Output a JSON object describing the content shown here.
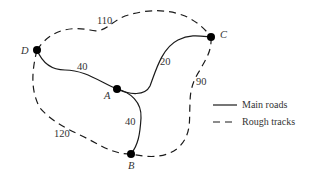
{
  "diagram": {
    "type": "network-graph",
    "nodes": [
      {
        "id": "A",
        "label": "A"
      },
      {
        "id": "B",
        "label": "B"
      },
      {
        "id": "C",
        "label": "C"
      },
      {
        "id": "D",
        "label": "D"
      }
    ],
    "edges": [
      {
        "from": "D",
        "to": "A",
        "weight": "40",
        "type": "Main roads"
      },
      {
        "from": "A",
        "to": "C",
        "weight": "20",
        "type": "Main roads"
      },
      {
        "from": "A",
        "to": "B",
        "weight": "40",
        "type": "Main roads"
      },
      {
        "from": "D",
        "to": "C",
        "weight": "110",
        "type": "Rough tracks"
      },
      {
        "from": "C",
        "to": "B",
        "weight": "90",
        "type": "Rough tracks"
      },
      {
        "from": "D",
        "to": "B",
        "weight": "120",
        "type": "Rough tracks"
      }
    ],
    "legend": {
      "main": "Main roads",
      "rough": "Rough tracks"
    },
    "colors": {
      "line": "#1a1a1a",
      "text": "#333333",
      "background": "#ffffff"
    }
  }
}
